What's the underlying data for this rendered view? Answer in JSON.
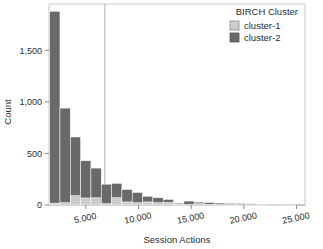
{
  "chart_data": {
    "type": "bar",
    "title": "",
    "subtitle": "",
    "xlabel": "Session Actions",
    "ylabel": "Count",
    "xlim": [
      1500,
      25800
    ],
    "ylim": [
      0,
      1950
    ],
    "grid": false,
    "stacked": true,
    "bin_width": 980,
    "legend": {
      "title": "BIRCH Cluster",
      "position": "top-right",
      "entries": [
        {
          "name": "cluster-1",
          "color": "#cccccc"
        },
        {
          "name": "cluster-2",
          "color": "#696969"
        }
      ]
    },
    "xticks": [
      5000,
      10000,
      15000,
      20000,
      25000
    ],
    "xtick_labels": [
      "5.000",
      "10.000",
      "15.000",
      "20.000",
      "25.000"
    ],
    "yticks": [
      0,
      500,
      1000,
      1500
    ],
    "ytick_labels": [
      "0",
      "500",
      "1,000",
      "1,500"
    ],
    "bin_centers": [
      2050,
      3030,
      4010,
      4990,
      5970,
      6950,
      7930,
      8910,
      9890,
      10870,
      11850,
      12830,
      13810,
      14790,
      15770,
      16750,
      17730,
      18710,
      19690,
      20670,
      21650,
      22630,
      23610,
      24590
    ],
    "series": [
      {
        "name": "cluster-1",
        "color": "#cccccc",
        "values": [
          18,
          22,
          90,
          68,
          70,
          12,
          70,
          30,
          22,
          30,
          22,
          24,
          8,
          6,
          12,
          6,
          5,
          4,
          4,
          3,
          2,
          1,
          1,
          1
        ]
      },
      {
        "name": "cluster-2",
        "color": "#696969",
        "values": [
          1862,
          918,
          570,
          362,
          288,
          190,
          140,
          120,
          100,
          55,
          48,
          30,
          10,
          32,
          16,
          18,
          14,
          12,
          11,
          8,
          4,
          2,
          2,
          4
        ]
      }
    ],
    "annotations": [
      {
        "type": "vline",
        "x": 6800,
        "color": "#b0b0b0",
        "width": 1
      }
    ]
  }
}
